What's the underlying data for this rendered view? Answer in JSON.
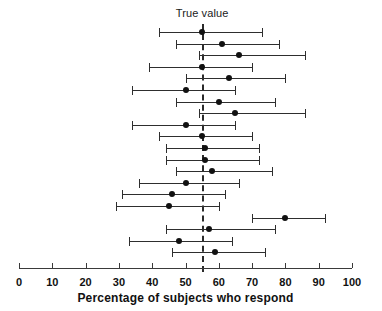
{
  "chart_data": {
    "type": "scatter",
    "subtype": "forest-plot",
    "title": "",
    "xlabel": "Percentage of subjects who respond",
    "ylabel": "",
    "xlim": [
      0,
      100
    ],
    "xticks": [
      0,
      10,
      20,
      30,
      40,
      50,
      60,
      70,
      80,
      90,
      100
    ],
    "xticklabels": [
      "0",
      "10",
      "20",
      "30",
      "40",
      "50",
      "60",
      "70",
      "80",
      "90",
      "100"
    ],
    "grid": false,
    "legend": null,
    "annotations": [
      {
        "name": "true-value-label",
        "text": "True value",
        "x": 55,
        "y_position": "top"
      }
    ],
    "reference_line": {
      "label": "True value",
      "value": 55,
      "style": "dashed",
      "color": "#2b2b2b"
    },
    "marker_color": "#111111",
    "line_color": "#2e2e2e",
    "studies": [
      {
        "index": 1,
        "estimate": 55,
        "low": 42,
        "high": 73
      },
      {
        "index": 2,
        "estimate": 61,
        "low": 47,
        "high": 78
      },
      {
        "index": 3,
        "estimate": 66,
        "low": 54,
        "high": 86
      },
      {
        "index": 4,
        "estimate": 55,
        "low": 39,
        "high": 70
      },
      {
        "index": 5,
        "estimate": 63,
        "low": 50,
        "high": 80
      },
      {
        "index": 6,
        "estimate": 50,
        "low": 34,
        "high": 65
      },
      {
        "index": 7,
        "estimate": 60,
        "low": 47,
        "high": 77
      },
      {
        "index": 8,
        "estimate": 65,
        "low": 54,
        "high": 86
      },
      {
        "index": 9,
        "estimate": 50,
        "low": 34,
        "high": 65
      },
      {
        "index": 10,
        "estimate": 55,
        "low": 42,
        "high": 70
      },
      {
        "index": 11,
        "estimate": 56,
        "low": 44,
        "high": 72
      },
      {
        "index": 12,
        "estimate": 56,
        "low": 44,
        "high": 72
      },
      {
        "index": 13,
        "estimate": 58,
        "low": 47,
        "high": 76
      },
      {
        "index": 14,
        "estimate": 50,
        "low": 36,
        "high": 66
      },
      {
        "index": 15,
        "estimate": 46,
        "low": 31,
        "high": 62
      },
      {
        "index": 16,
        "estimate": 45,
        "low": 29,
        "high": 60
      },
      {
        "index": 17,
        "estimate": 80,
        "low": 70,
        "high": 92
      },
      {
        "index": 18,
        "estimate": 57,
        "low": 44,
        "high": 77
      },
      {
        "index": 19,
        "estimate": 48,
        "low": 33,
        "high": 64
      },
      {
        "index": 20,
        "estimate": 59,
        "low": 46,
        "high": 74
      }
    ]
  },
  "layout": {
    "x_origin_px": 19,
    "px_per_unit": 3.33,
    "first_row_y_px": 27,
    "row_step_px": 11.6,
    "axis_y_px": 268,
    "tick_len_px": 5,
    "vline_top_px": 24,
    "vline_bottom_px": 272,
    "true_label_y_px": 7,
    "tick_label_y_px": 276,
    "xtitle_y_px": 291
  }
}
